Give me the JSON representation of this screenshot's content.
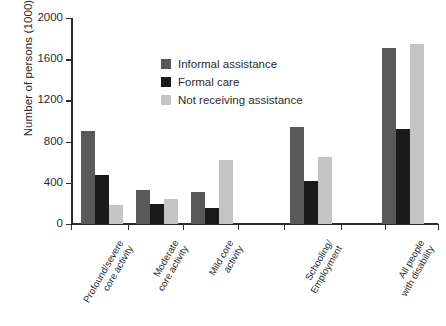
{
  "chart_data": {
    "type": "bar",
    "title": "",
    "xlabel": "",
    "ylabel": "Number of persons (1000)",
    "ylim": [
      0,
      2000
    ],
    "yticks": [
      0,
      400,
      800,
      1200,
      1600,
      2000
    ],
    "ytick_labels": [
      "0",
      "400",
      "800",
      "1200",
      "1600",
      "2000"
    ],
    "grid": false,
    "legend_position": "inside-top-center",
    "categories": [
      "Profound/severe\ncore activity",
      "Moderate\ncore activity",
      "Mild core\nactivity",
      "Schooling/\nEmployment",
      "All people\nwith disability"
    ],
    "series": [
      {
        "name": "Informal assistance",
        "color": "#595959",
        "values": [
          900,
          335,
          310,
          940,
          1710
        ]
      },
      {
        "name": "Formal care",
        "color": "#1a1a1a",
        "values": [
          480,
          190,
          155,
          420,
          920
        ]
      },
      {
        "name": "Not receiving assistance",
        "color": "#c4c4c4",
        "values": [
          180,
          240,
          620,
          655,
          1745
        ]
      }
    ]
  },
  "axis": {
    "y_title": "Number of persons (1000)"
  },
  "colors": {
    "axis": "#2b2b2b",
    "background": "#ffffff",
    "informal": "#595959",
    "formal": "#1a1a1a",
    "not_receiving": "#c4c4c4"
  }
}
